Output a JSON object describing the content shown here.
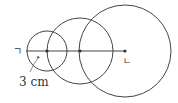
{
  "diagram": {
    "labels": {
      "start_point": "ㄱ",
      "end_point": "ㄴ",
      "radius_label": "3 cm"
    },
    "circles": [
      {
        "name": "small",
        "cx": 47,
        "cy": 51,
        "r": 20
      },
      {
        "name": "middle",
        "cx": 80,
        "cy": 51,
        "r": 33
      },
      {
        "name": "large",
        "cx": 125,
        "cy": 51,
        "r": 46
      }
    ],
    "segment": {
      "x1": 26,
      "y1": 51,
      "x2": 125,
      "y2": 51
    },
    "points": [
      {
        "name": "center-small",
        "x": 47,
        "y": 51
      },
      {
        "name": "center-middle",
        "x": 80,
        "y": 51
      },
      {
        "name": "center-large",
        "x": 125,
        "y": 51
      }
    ],
    "colors": {
      "stroke": "#444444",
      "background": "#ffffff"
    }
  }
}
